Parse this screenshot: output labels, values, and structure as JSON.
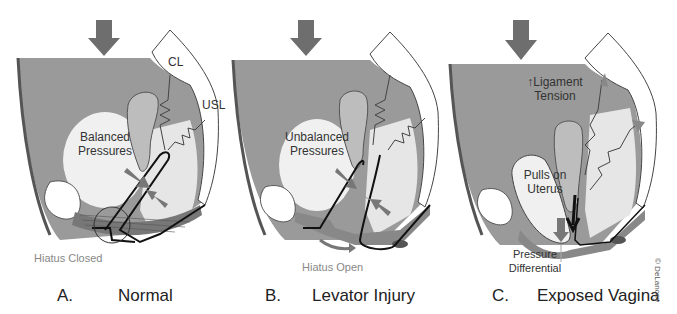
{
  "panels": [
    {
      "id": "A",
      "letter": "A.",
      "title": "Normal",
      "labels": {
        "center": [
          "Balanced",
          "Pressures"
        ],
        "ligament_1": "CL",
        "ligament_2": "USL",
        "hiatus": "Hiatus Closed"
      }
    },
    {
      "id": "B",
      "letter": "B.",
      "title": "Levator Injury",
      "labels": {
        "center": [
          "Unbalanced",
          "Pressures"
        ],
        "hiatus": "Hiatus Open"
      }
    },
    {
      "id": "C",
      "letter": "C.",
      "title": "Exposed Vagina",
      "labels": {
        "top": [
          "↑Ligament",
          "Tension"
        ],
        "center": [
          "Pulls on",
          "Uterus"
        ],
        "bottom": [
          "Pressure",
          "Differential"
        ]
      }
    }
  ],
  "credit": "© DeLancey",
  "colors": {
    "abdomen": "#9a9a9a",
    "bladder": "#efefef",
    "uterus": "#bdbdbd",
    "arrow": "#6e6e6e",
    "levator": "#7a7a7a",
    "outline": "#111111",
    "pubic_bone": "#ffffff",
    "sacrum": "#ffffff"
  }
}
